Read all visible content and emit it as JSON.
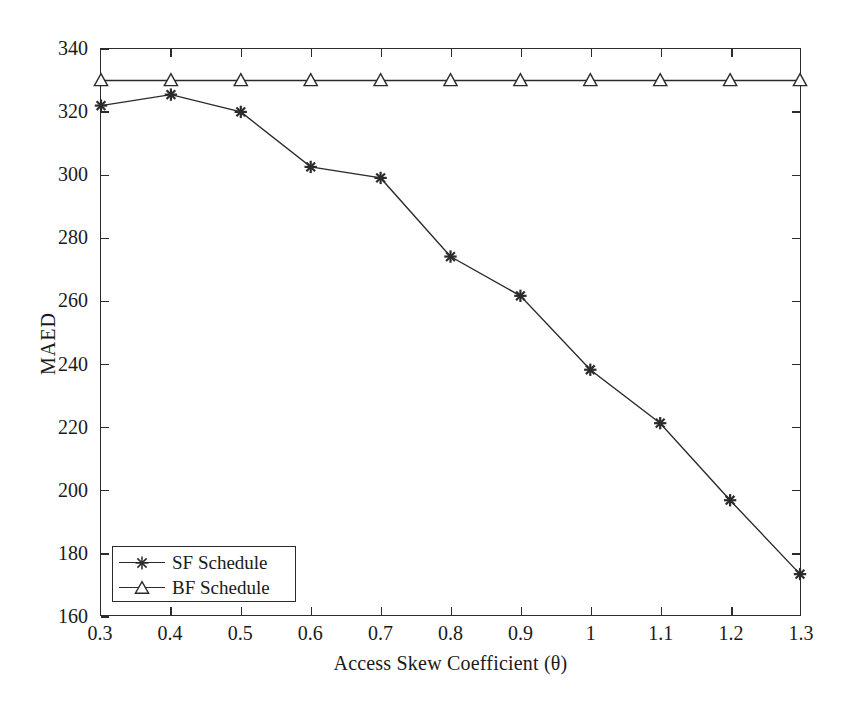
{
  "chart_data": {
    "type": "line",
    "title": "",
    "xlabel": "Access Skew Coefficient (θ)",
    "ylabel": "MAED",
    "x": [
      0.3,
      0.4,
      0.5,
      0.6,
      0.7,
      0.8,
      0.9,
      1.0,
      1.1,
      1.2,
      1.3
    ],
    "xtick_labels": [
      "0.3",
      "0.4",
      "0.5",
      "0.6",
      "0.7",
      "0.8",
      "0.9",
      "1",
      "1.1",
      "1.2",
      "1.3"
    ],
    "ytick_labels": [
      "160",
      "180",
      "200",
      "220",
      "240",
      "260",
      "280",
      "300",
      "320",
      "340"
    ],
    "yticks": [
      160,
      180,
      200,
      220,
      240,
      260,
      280,
      300,
      320,
      340
    ],
    "xlim": [
      0.3,
      1.3
    ],
    "ylim": [
      160,
      340
    ],
    "grid": false,
    "legend_position": "lower-left",
    "series": [
      {
        "name": "SF Schedule",
        "marker": "asterisk",
        "color": "#2b2b2b",
        "values": [
          322,
          325.5,
          320,
          302.5,
          299,
          274,
          261.5,
          238,
          221,
          196.5,
          173
        ]
      },
      {
        "name": "BF Schedule",
        "marker": "triangle-up",
        "color": "#2b2b2b",
        "values": [
          330,
          330,
          330,
          330,
          330,
          330,
          330,
          330,
          330,
          330,
          330
        ]
      }
    ]
  },
  "legend": {
    "entries": [
      {
        "label": "SF Schedule",
        "marker": "asterisk-marker-icon"
      },
      {
        "label": "BF Schedule",
        "marker": "triangle-marker-icon"
      }
    ]
  },
  "axes": {
    "x_title": "Access Skew Coefficient (θ)",
    "y_title": "MAED"
  },
  "colors": {
    "line": "#2b2b2b",
    "axis": "#2b2b2b",
    "background": "#ffffff",
    "text": "#1a1a1a"
  }
}
